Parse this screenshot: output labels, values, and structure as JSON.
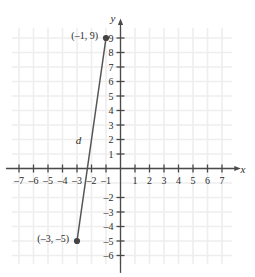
{
  "chart_data": {
    "type": "scatter",
    "title": "",
    "subtitle": "",
    "xlabel": "x",
    "ylabel": "y",
    "xlim": [
      -8,
      8
    ],
    "ylim": [
      -7,
      10
    ],
    "grid": true,
    "legend": "none",
    "x_ticks": [
      -7,
      -6,
      -5,
      -4,
      -3,
      -2,
      -1,
      1,
      2,
      3,
      4,
      5,
      6,
      7
    ],
    "x_tick_labels": [
      "–7",
      "–6",
      "–5",
      "–4",
      "–3",
      "–2",
      "–1",
      "1",
      "2",
      "3",
      "4",
      "5",
      "6",
      "7"
    ],
    "y_ticks": [
      9,
      8,
      7,
      6,
      5,
      4,
      3,
      2,
      1,
      -2,
      -3,
      -4,
      -5,
      -6
    ],
    "y_tick_labels": [
      "9",
      "8",
      "7",
      "6",
      "5",
      "4",
      "3",
      "2",
      "1",
      "–2",
      "–3",
      "–4",
      "–5",
      "–6"
    ],
    "points": [
      {
        "name": "point-upper",
        "x": -1,
        "y": 9,
        "label": "(–1, 9)"
      },
      {
        "name": "point-lower",
        "x": -3,
        "y": -5,
        "label": "(–3, –5)"
      }
    ],
    "segments": [
      {
        "name": "distance-segment",
        "from": [
          -3,
          -5
        ],
        "to": [
          -1,
          9
        ],
        "label": "d"
      }
    ],
    "colors": {
      "grid": "#eeeeee",
      "axis": "#4a4a4a",
      "segment": "#555555",
      "point": "#444444",
      "text": "#2b2b2b"
    }
  },
  "labels": {
    "y_axis": "y",
    "x_axis": "x",
    "segment_d": "d",
    "upper_point": "(–1, 9)",
    "lower_point": "(–3, –5)"
  }
}
